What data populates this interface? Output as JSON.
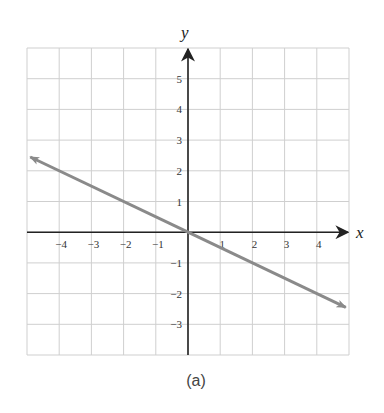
{
  "chart_data": {
    "type": "line",
    "title": "",
    "caption": "(a)",
    "xlabel": "x",
    "ylabel": "y",
    "xlim": [
      -5,
      5
    ],
    "ylim": [
      -4,
      6
    ],
    "grid": true,
    "x_ticks": [
      -4,
      -3,
      -2,
      -1,
      1,
      2,
      3,
      4
    ],
    "y_ticks": [
      5,
      4,
      3,
      2,
      1,
      -1,
      -2,
      -3
    ],
    "x_tick_labels": [
      "−4",
      "−3",
      "−2",
      "−1",
      "1",
      "2",
      "3",
      "4"
    ],
    "y_tick_labels": [
      "5",
      "4",
      "3",
      "2",
      "1",
      "−1",
      "−2",
      "−3"
    ],
    "series": [
      {
        "name": "y = -x/2",
        "equation": "y = -0.5x",
        "x": [
          -4.9,
          0,
          4.9
        ],
        "y": [
          2.45,
          0,
          -2.45
        ],
        "arrows": "both",
        "color": "#8a8a8a"
      }
    ]
  },
  "colors": {
    "grid": "#cfcfcf",
    "axis": "#222222",
    "line": "#8a8a8a"
  }
}
